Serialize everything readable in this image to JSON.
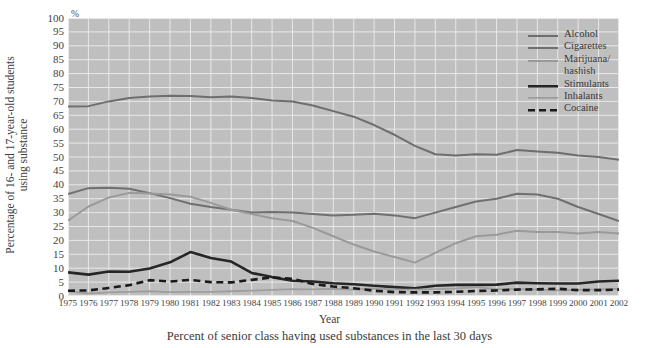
{
  "axes": {
    "ylabel_lines": [
      "Percentage of 16- and 17-year-old students",
      "using substance"
    ],
    "xlabel": "Year",
    "unit_symbol": "%",
    "yticks": [
      0,
      5,
      10,
      15,
      20,
      25,
      30,
      35,
      40,
      45,
      50,
      55,
      60,
      65,
      70,
      75,
      80,
      85,
      90,
      95,
      100
    ]
  },
  "caption": "Percent of senior class having used substances in the last 30 days",
  "legend": {
    "entries": [
      {
        "label": "Alcohol",
        "label2": ""
      },
      {
        "label": "Cigarettes",
        "label2": ""
      },
      {
        "label": "Marijuana/",
        "label2": "hashish"
      },
      {
        "label": "Stimulants",
        "label2": ""
      },
      {
        "label": "Inhalants",
        "label2": ""
      },
      {
        "label": "Cocaine",
        "label2": ""
      }
    ]
  },
  "colors": {
    "plot_background": "#bfbfbf",
    "gridline": "#e8e8e8",
    "alcohol": "#6e6e6e",
    "cigarettes": "#707070",
    "marijuana": "#9a9a9a",
    "stimulants": "#262626",
    "inhalants": "#9e9e9e",
    "cocaine": "#1a1a1a",
    "text": "#3a3a3a"
  },
  "chart_data": {
    "type": "line",
    "title": "",
    "subtitle": "",
    "caption": "Percent of senior class having used substances in the last 30 days",
    "xlabel": "Year",
    "ylabel": "Percentage of 16- and 17-year-old students using substance",
    "yunit": "%",
    "xlim": [
      1975,
      2002
    ],
    "ylim": [
      0,
      100
    ],
    "ytick_step": 5,
    "grid": true,
    "legend_position": "top-right-inside",
    "x": [
      1975,
      1976,
      1977,
      1978,
      1979,
      1980,
      1981,
      1982,
      1983,
      1984,
      1985,
      1986,
      1987,
      1988,
      1989,
      1990,
      1991,
      1992,
      1993,
      1994,
      1995,
      1996,
      1997,
      1998,
      1999,
      2000,
      2001,
      2002
    ],
    "series": [
      {
        "name": "Alcohol",
        "color": "#6e6e6e",
        "style": "solid",
        "width": 2.0,
        "values": [
          68.2,
          68.3,
          70.0,
          71.2,
          71.8,
          72.0,
          71.9,
          71.5,
          71.8,
          71.2,
          70.3,
          70.0,
          68.5,
          66.5,
          64.5,
          61.5,
          58.0,
          54.0,
          51.0,
          50.5,
          51.0,
          50.8,
          52.5,
          52.0,
          51.5,
          50.5,
          50.0,
          49.0
        ]
      },
      {
        "name": "Cigarettes",
        "color": "#707070",
        "style": "solid",
        "width": 2.0,
        "values": [
          36.7,
          38.8,
          38.9,
          38.6,
          37.0,
          35.2,
          33.2,
          32.0,
          31.0,
          30.0,
          30.2,
          30.0,
          29.5,
          29.0,
          29.2,
          29.6,
          29.0,
          28.0,
          30.0,
          32.0,
          34.0,
          35.0,
          36.8,
          36.5,
          35.0,
          32.0,
          29.5,
          27.0
        ]
      },
      {
        "name": "Marijuana/hashish",
        "color": "#9a9a9a",
        "style": "solid",
        "width": 2.0,
        "values": [
          27.1,
          32.2,
          35.4,
          37.1,
          36.9,
          36.5,
          35.7,
          33.5,
          31.0,
          29.5,
          28.0,
          27.0,
          24.5,
          21.5,
          18.5,
          16.0,
          14.0,
          12.0,
          15.5,
          19.0,
          21.5,
          22.0,
          23.5,
          23.0,
          23.0,
          22.5,
          23.0,
          22.5
        ]
      },
      {
        "name": "Stimulants",
        "color": "#262626",
        "style": "solid",
        "width": 2.6,
        "values": [
          8.5,
          7.7,
          8.8,
          8.7,
          9.9,
          12.1,
          15.8,
          13.7,
          12.4,
          8.3,
          6.8,
          5.5,
          5.2,
          4.6,
          4.2,
          3.7,
          3.2,
          2.8,
          3.7,
          4.0,
          4.0,
          4.1,
          4.8,
          4.6,
          4.5,
          4.5,
          5.2,
          5.5
        ]
      },
      {
        "name": "Inhalants",
        "color": "#9e9e9e",
        "style": "solid",
        "width": 1.8,
        "values": [
          1.7,
          0.9,
          1.3,
          1.5,
          1.7,
          1.4,
          1.5,
          1.5,
          1.7,
          1.9,
          2.2,
          2.5,
          2.4,
          2.6,
          2.3,
          2.7,
          2.4,
          2.3,
          2.5,
          2.7,
          3.2,
          2.5,
          2.5,
          2.3,
          2.0,
          2.2,
          2.4,
          2.6
        ]
      },
      {
        "name": "Cocaine",
        "color": "#1a1a1a",
        "style": "dashed",
        "width": 2.6,
        "values": [
          1.9,
          2.0,
          2.9,
          3.9,
          5.7,
          5.2,
          5.8,
          5.0,
          4.9,
          5.8,
          6.7,
          6.2,
          4.3,
          3.4,
          2.8,
          1.9,
          1.4,
          1.3,
          1.3,
          1.5,
          1.8,
          2.0,
          2.3,
          2.4,
          2.6,
          2.1,
          2.1,
          2.3
        ]
      }
    ]
  }
}
